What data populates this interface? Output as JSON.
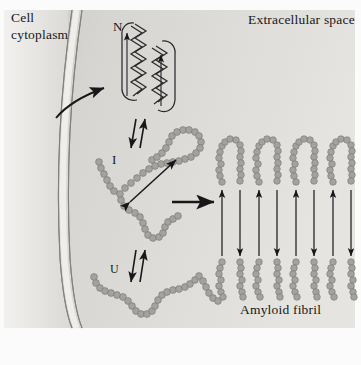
{
  "figure": {
    "width": 361,
    "height": 365,
    "background_color": "#fbfbfb",
    "panel_color": "#d3d2cf",
    "panel_color_light": "#e8e7e4",
    "ink_color": "#17171a",
    "bead_color": "#9a9a97",
    "bead_outline": "#6e6e6b"
  },
  "labels": {
    "cell_cytoplasm_line1": "Cell",
    "cell_cytoplasm_line2": "cytoplasm",
    "extracellular_space": "Extracellular space",
    "amyloid_fibril": "Amyloid fibril",
    "state_native": "N",
    "state_intermediate": "I",
    "state_unfolded": "U"
  },
  "states": [
    {
      "symbol": "N",
      "name": "native-folded-protein",
      "description": "Two alpha-helices drawn as zigzag coils"
    },
    {
      "symbol": "I",
      "name": "partially-folded-intermediate",
      "description": "Beaded chain with a folded hairpin loop and internal double-headed arrow"
    },
    {
      "symbol": "U",
      "name": "unfolded-protein",
      "description": "Extended beaded random coil chain"
    }
  ],
  "arrows": {
    "translocation": "curved-arrow-across-membrane",
    "equilibrium_n_i": "double-headed-equilibrium-arrow",
    "equilibrium_i_u": "double-headed-equilibrium-arrow",
    "aggregation": "horizontal-arrow-to-fibril",
    "interstrand": "vertical-double-headed-arrow"
  },
  "fibril": {
    "unit_count": 4,
    "unit_name": "fibril-hairpin-unit",
    "interstrand_arrows_per_unit": 2
  },
  "membrane": {
    "name": "cell-membrane",
    "style": "curved-double-line"
  }
}
